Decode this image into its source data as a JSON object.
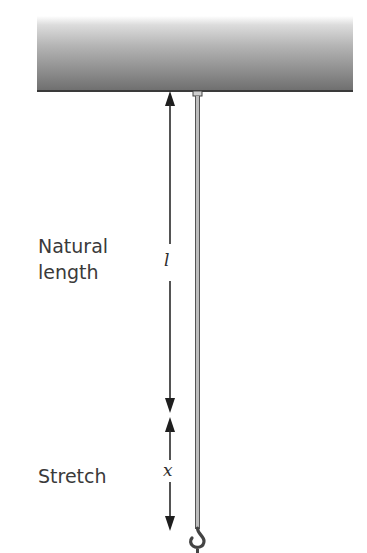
{
  "diagram": {
    "title": "",
    "labels": {
      "clipped_left_text": "f",
      "natural_length_line1": "Natural",
      "natural_length_line2": "length",
      "stretch": "Stretch"
    },
    "variables": {
      "natural_length_symbol": "l",
      "stretch_symbol": "x"
    },
    "elements": [
      {
        "id": "ceiling",
        "type": "fixed support",
        "shading": "gradient gray"
      },
      {
        "id": "string",
        "type": "elastic string / spring rod",
        "attached_to": "ceiling"
      },
      {
        "id": "hook",
        "type": "hook",
        "position": "bottom of string"
      },
      {
        "id": "arrow-l",
        "type": "double-headed dimension arrow",
        "label": "l",
        "spans": "natural length"
      },
      {
        "id": "arrow-x",
        "type": "double-headed dimension arrow",
        "label": "x",
        "spans": "stretch"
      }
    ],
    "colors": {
      "text": "#3a3a3a",
      "lines": "#2a2a2a",
      "rod_edge": "#555555",
      "rod_core": "#bdbdbd"
    }
  }
}
